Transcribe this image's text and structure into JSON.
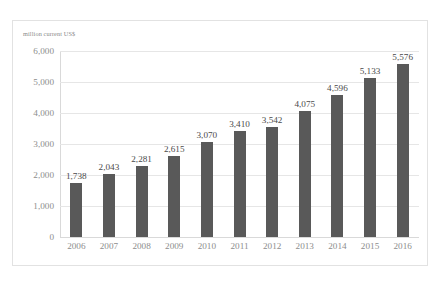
{
  "axis_unit_label": "million current US$",
  "colors": {
    "bar": "#595959",
    "gridline": "#e6e6e6",
    "axis_line": "#d9d9d9",
    "tick_text": "#8d8d8d",
    "label_text": "#4a4a4a",
    "frame_border": "#e2e2e2",
    "background": "#ffffff"
  },
  "chart_data": {
    "type": "bar",
    "title": "",
    "subtitle": "",
    "xlabel": "",
    "ylabel": "million current US$",
    "categories": [
      "2006",
      "2007",
      "2008",
      "2009",
      "2010",
      "2011",
      "2012",
      "2013",
      "2014",
      "2015",
      "2016"
    ],
    "values": [
      1738,
      2043,
      2281,
      2615,
      3070,
      3410,
      3542,
      4075,
      4596,
      5133,
      5576
    ],
    "value_labels": [
      "1,738",
      "2,043",
      "2,281",
      "2,615",
      "3,070",
      "3,410",
      "3,542",
      "4,075",
      "4,596",
      "5,133",
      "5,576"
    ],
    "ylim": [
      0,
      6000
    ],
    "ytick_values": [
      0,
      1000,
      2000,
      3000,
      4000,
      5000,
      6000
    ],
    "ytick_labels": [
      "0",
      "1,000",
      "2,000",
      "3,000",
      "4,000",
      "5,000",
      "6,000"
    ],
    "grid": true,
    "grid_axis": "y",
    "legend": false,
    "legend_position": "none",
    "series": [
      {
        "name": "",
        "values": [
          1738,
          2043,
          2281,
          2615,
          3070,
          3410,
          3542,
          4075,
          4596,
          5133,
          5576
        ]
      }
    ],
    "annotations": []
  }
}
